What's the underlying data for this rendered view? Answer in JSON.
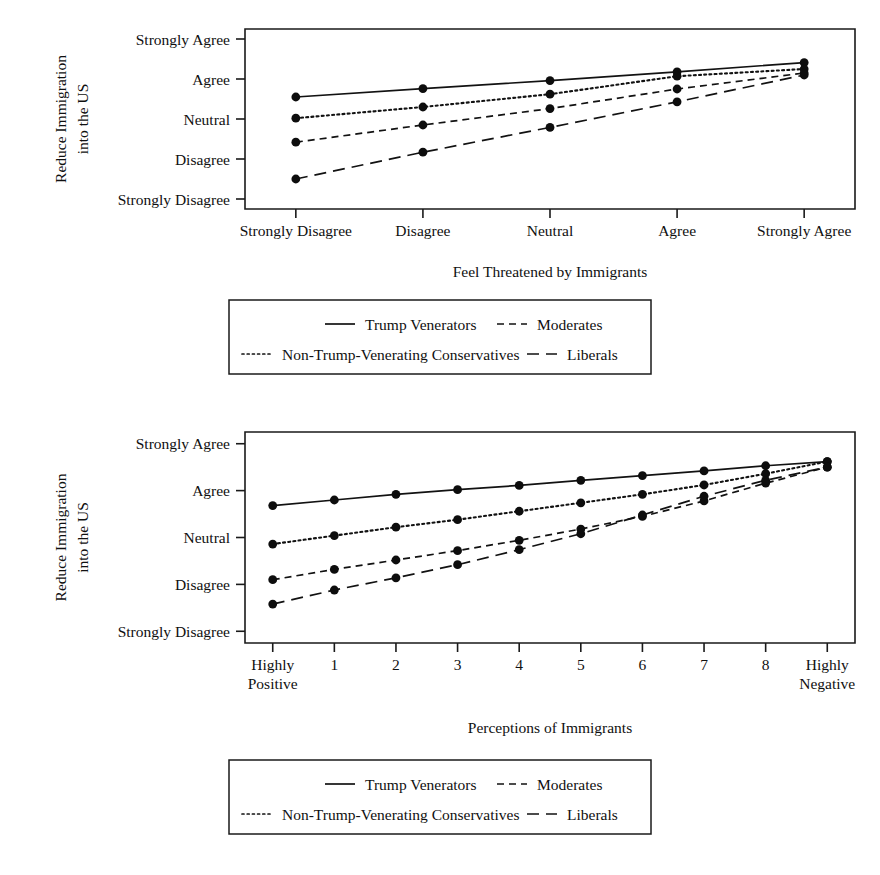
{
  "figure": {
    "series_names": [
      "Trump Venerators",
      "Moderates",
      "Non-Trump-Venerating Conservatives",
      "Liberals"
    ],
    "y_axis_title_line1": "Reduce Immigration",
    "y_axis_title_line2": "into the US",
    "y_tick_labels": [
      "Strongly Agree",
      "Agree",
      "Neutral",
      "Disagree",
      "Strongly Disagree"
    ]
  },
  "chart_data": [
    {
      "id": "top",
      "type": "line",
      "title": "",
      "xlabel": "Feel Threatened by Immigrants",
      "ylabel": "Reduce Immigration into the US",
      "categories": [
        "Strongly Disagree",
        "Disagree",
        "Neutral",
        "Agree",
        "Strongly Agree"
      ],
      "x": [
        1,
        2,
        3,
        4,
        5
      ],
      "ytick_labels": [
        "Strongly Disagree",
        "Disagree",
        "Neutral",
        "Agree",
        "Strongly Agree"
      ],
      "ytick_values": [
        1,
        2,
        3,
        4,
        5
      ],
      "ylim": [
        0.75,
        5.25
      ],
      "xlim": [
        0.6,
        5.4
      ],
      "grid": false,
      "legend_position": "below",
      "series": [
        {
          "name": "Trump Venerators",
          "style": "solid",
          "values": [
            3.55,
            3.76,
            3.96,
            4.18,
            4.41
          ]
        },
        {
          "name": "Non-Trump-Venerating Conservatives",
          "style": "dotted",
          "values": [
            3.02,
            3.3,
            3.62,
            4.07,
            4.25
          ]
        },
        {
          "name": "Moderates",
          "style": "dashed",
          "values": [
            2.42,
            2.85,
            3.26,
            3.75,
            4.15
          ]
        },
        {
          "name": "Liberals",
          "style": "longdash",
          "values": [
            1.5,
            2.17,
            2.79,
            3.43,
            4.1
          ]
        }
      ]
    },
    {
      "id": "bottom",
      "type": "line",
      "title": "",
      "xlabel": "Perceptions of Immigrants",
      "ylabel": "Reduce Immigration into the US",
      "categories": [
        "Highly\nPositive",
        "1",
        "2",
        "3",
        "4",
        "5",
        "6",
        "7",
        "8",
        "Highly\nNegative"
      ],
      "categories_flat": [
        "Highly Positive",
        "1",
        "2",
        "3",
        "4",
        "5",
        "6",
        "7",
        "8",
        "Highly Negative"
      ],
      "x": [
        0,
        1,
        2,
        3,
        4,
        5,
        6,
        7,
        8,
        9
      ],
      "ytick_labels": [
        "Strongly Disagree",
        "Disagree",
        "Neutral",
        "Agree",
        "Strongly Agree"
      ],
      "ytick_values": [
        1,
        2,
        3,
        4,
        5
      ],
      "ylim": [
        0.75,
        5.25
      ],
      "xlim": [
        -0.45,
        9.45
      ],
      "grid": false,
      "legend_position": "below",
      "series": [
        {
          "name": "Trump Venerators",
          "style": "solid",
          "values": [
            3.68,
            3.8,
            3.92,
            4.02,
            4.11,
            4.22,
            4.32,
            4.42,
            4.53,
            4.62
          ]
        },
        {
          "name": "Non-Trump-Venerating Conservatives",
          "style": "dotted",
          "values": [
            2.86,
            3.04,
            3.22,
            3.38,
            3.56,
            3.74,
            3.92,
            4.12,
            4.36,
            4.62
          ]
        },
        {
          "name": "Moderates",
          "style": "dashed",
          "values": [
            2.1,
            2.32,
            2.52,
            2.72,
            2.94,
            3.18,
            3.45,
            3.78,
            4.16,
            4.5
          ]
        },
        {
          "name": "Liberals",
          "style": "longdash",
          "values": [
            1.58,
            1.88,
            2.14,
            2.42,
            2.74,
            3.08,
            3.48,
            3.88,
            4.22,
            4.5
          ]
        }
      ]
    }
  ],
  "legend": {
    "entries": [
      {
        "label": "Trump Venerators",
        "style": "solid"
      },
      {
        "label": "Moderates",
        "style": "dashed"
      },
      {
        "label": "Non-Trump-Venerating Conservatives",
        "style": "dotted"
      },
      {
        "label": "Liberals",
        "style": "longdash"
      }
    ]
  }
}
